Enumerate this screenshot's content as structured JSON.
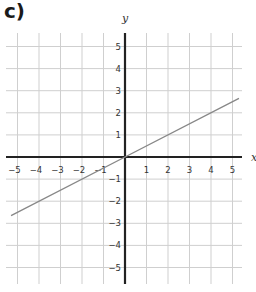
{
  "label": "c)",
  "chart_data": {
    "type": "line",
    "title": "",
    "xlabel": "x",
    "ylabel": "y",
    "xlim": [
      -5.5,
      5.5
    ],
    "ylim": [
      -5.6,
      5.6
    ],
    "grid": true,
    "x_ticks": [
      -5,
      -4,
      -3,
      -2,
      -1,
      1,
      2,
      3,
      4,
      5
    ],
    "y_ticks": [
      5,
      4,
      3,
      2,
      1,
      -1,
      -2,
      -3,
      -4,
      -5
    ],
    "series": [
      {
        "name": "line",
        "equation": "y = 0.5x",
        "x": [
          -5.3,
          0,
          5.3
        ],
        "y": [
          -2.65,
          0,
          2.65
        ],
        "color": "#888888"
      }
    ]
  },
  "colors": {
    "grid": "#cfcfcf",
    "axis": "#222222",
    "line": "#888888"
  }
}
